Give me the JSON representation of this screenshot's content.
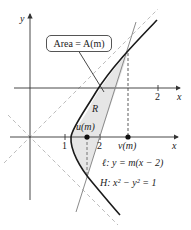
{
  "figure": {
    "area_label": "Area = A(m)",
    "region_label": "R",
    "axis_y_label": "y",
    "upper_axis": {
      "x_label": "x",
      "tick_label": "2"
    },
    "lower_axis": {
      "x_label": "x",
      "tick_1": "1",
      "tick_2": "2",
      "u_label": "u(m)",
      "v_label": "v(m)"
    },
    "line_label": "ℓ: y = m(x − 2)",
    "hyperbola_label": "H: x² − y² = 1",
    "colors": {
      "hyperbola": "#1a1a1a",
      "line": "#8a8a8a",
      "asymptote": "#b5b5b5",
      "region_fill": "#e6e6e6",
      "axis": "#333333"
    }
  }
}
